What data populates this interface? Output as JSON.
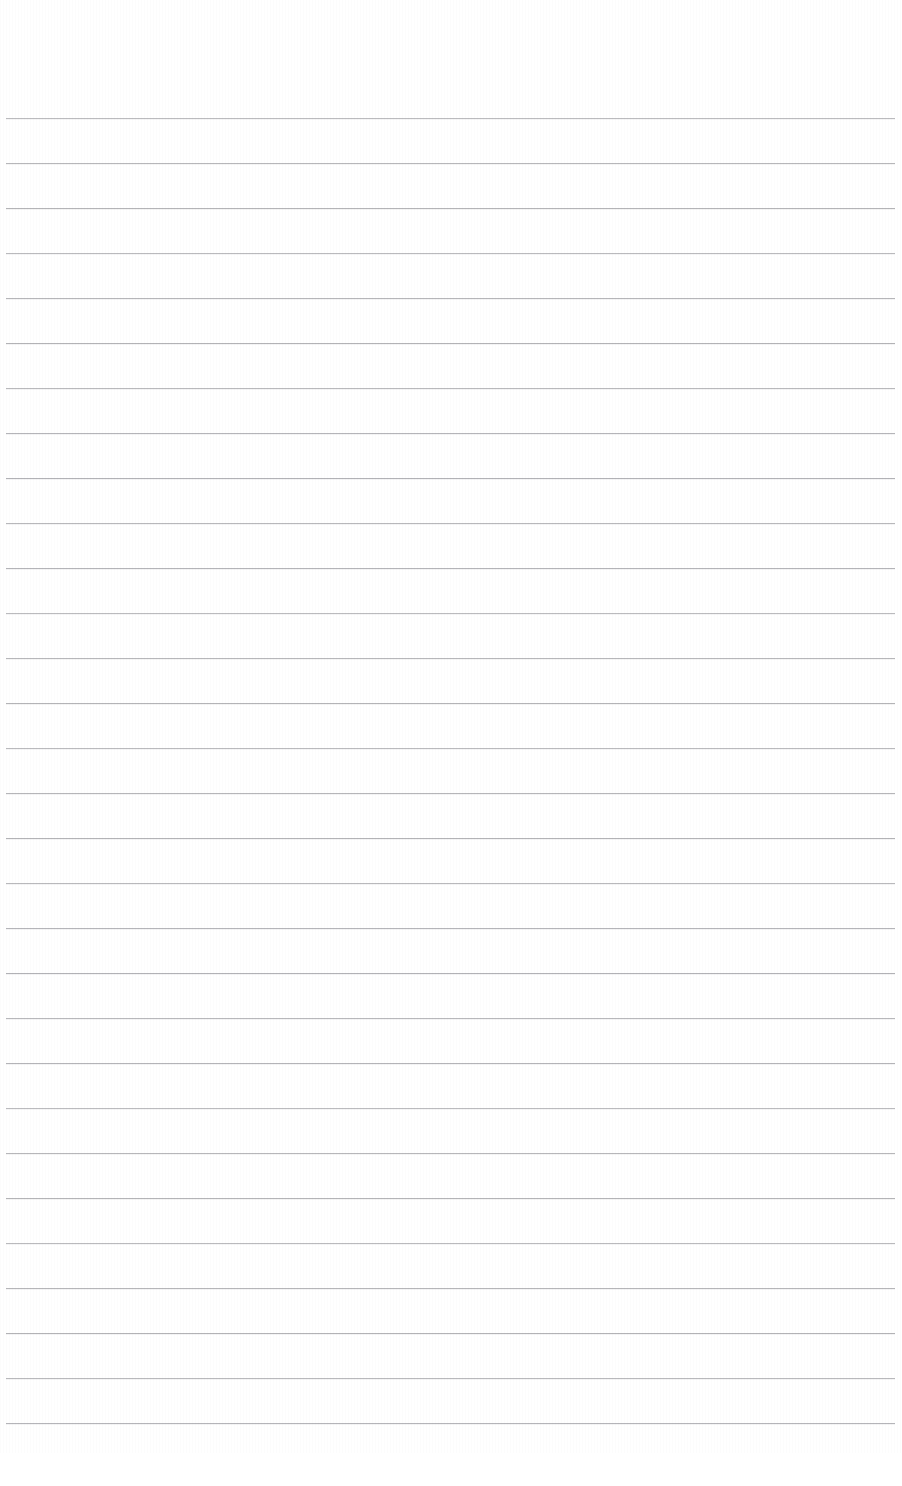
{
  "document": {
    "kind": "blank-ruled-paper",
    "title": "",
    "page_width": 902,
    "page_height": 1486,
    "background_color": "#ffffff",
    "has_text_content": false,
    "has_margin_line": false,
    "has_header": false,
    "has_footer": false,
    "header_text": "",
    "footer_text": "",
    "page_number": ""
  },
  "ruling": {
    "style": "horizontal-lined",
    "line_color": "#a8a8ac",
    "line_thickness_px": 1,
    "line_spacing_px": 45,
    "line_count": 30,
    "first_line_y": 118,
    "last_line_y": 1423,
    "line_start_x": 6,
    "line_end_x": 895,
    "line_length_px": 889,
    "top_margin_px": 118,
    "bottom_margin_px": 33,
    "left_margin_px": 6,
    "right_margin_px": 7,
    "line_ys": [
      118,
      163,
      208,
      253,
      298,
      343,
      388,
      433,
      478,
      523,
      568,
      613,
      658,
      703,
      748,
      793,
      838,
      883,
      928,
      973,
      1018,
      1063,
      1108,
      1153,
      1198,
      1243,
      1288,
      1333,
      1378,
      1423
    ]
  },
  "writing_rows": [
    {
      "index": 1,
      "text": ""
    },
    {
      "index": 2,
      "text": ""
    },
    {
      "index": 3,
      "text": ""
    },
    {
      "index": 4,
      "text": ""
    },
    {
      "index": 5,
      "text": ""
    },
    {
      "index": 6,
      "text": ""
    },
    {
      "index": 7,
      "text": ""
    },
    {
      "index": 8,
      "text": ""
    },
    {
      "index": 9,
      "text": ""
    },
    {
      "index": 10,
      "text": ""
    },
    {
      "index": 11,
      "text": ""
    },
    {
      "index": 12,
      "text": ""
    },
    {
      "index": 13,
      "text": ""
    },
    {
      "index": 14,
      "text": ""
    },
    {
      "index": 15,
      "text": ""
    },
    {
      "index": 16,
      "text": ""
    },
    {
      "index": 17,
      "text": ""
    },
    {
      "index": 18,
      "text": ""
    },
    {
      "index": 19,
      "text": ""
    },
    {
      "index": 20,
      "text": ""
    },
    {
      "index": 21,
      "text": ""
    },
    {
      "index": 22,
      "text": ""
    },
    {
      "index": 23,
      "text": ""
    },
    {
      "index": 24,
      "text": ""
    },
    {
      "index": 25,
      "text": ""
    },
    {
      "index": 26,
      "text": ""
    },
    {
      "index": 27,
      "text": ""
    },
    {
      "index": 28,
      "text": ""
    },
    {
      "index": 29,
      "text": ""
    },
    {
      "index": 30,
      "text": ""
    }
  ]
}
